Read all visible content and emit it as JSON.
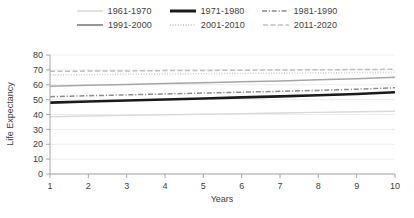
{
  "chart_data": {
    "type": "line",
    "title": "",
    "xlabel": "Years",
    "ylabel": "Life Expectancy",
    "x": [
      1,
      2,
      3,
      4,
      5,
      6,
      7,
      8,
      9,
      10
    ],
    "xlim": [
      1,
      10
    ],
    "ylim": [
      0,
      80
    ],
    "yticks": [
      0,
      10,
      20,
      30,
      40,
      50,
      60,
      70,
      80
    ],
    "xticks": [
      1,
      2,
      3,
      4,
      5,
      6,
      7,
      8,
      9,
      10
    ],
    "grid": "horizontal",
    "legend_position": "top",
    "series": [
      {
        "name": "1961-1970",
        "style": "solid",
        "color": "#d9d9d9",
        "width": 1.4,
        "values": [
          38.5,
          39.0,
          39.4,
          39.8,
          40.2,
          40.6,
          41.0,
          41.4,
          41.8,
          42.2
        ]
      },
      {
        "name": "1971-1980",
        "style": "solid",
        "color": "#1a1a1a",
        "width": 2.6,
        "values": [
          48.0,
          48.7,
          49.4,
          50.1,
          50.8,
          51.5,
          52.2,
          52.9,
          53.8,
          55.0
        ]
      },
      {
        "name": "1981-1990",
        "style": "dashdot",
        "color": "#8c8c8c",
        "width": 1.5,
        "values": [
          52.0,
          52.6,
          53.2,
          53.8,
          54.4,
          55.0,
          55.6,
          56.2,
          57.0,
          58.0
        ]
      },
      {
        "name": "1991-2000",
        "style": "solid",
        "color": "#a6a6a6",
        "width": 1.5,
        "values": [
          59.0,
          59.6,
          60.2,
          60.8,
          61.4,
          62.0,
          62.6,
          63.3,
          64.1,
          65.0
        ]
      },
      {
        "name": "2001-2010",
        "style": "dotted",
        "color": "#cfcfcf",
        "width": 1.6,
        "values": [
          66.6,
          66.8,
          67.0,
          67.2,
          67.4,
          67.6,
          67.8,
          68.0,
          68.2,
          68.4
        ]
      },
      {
        "name": "2011-2020",
        "style": "dashed",
        "color": "#bfbfbf",
        "width": 1.5,
        "values": [
          69.0,
          69.2,
          69.3,
          69.5,
          69.6,
          69.8,
          69.9,
          70.1,
          70.2,
          70.4
        ]
      }
    ]
  },
  "legend": {
    "rows": [
      [
        {
          "label": "1961-1970",
          "style": "solid",
          "color": "#d9d9d9",
          "width": 1.6
        },
        {
          "label": "1971-1980",
          "style": "solid",
          "color": "#1a1a1a",
          "width": 3.0
        },
        {
          "label": "1981-1990",
          "style": "dashdot",
          "color": "#8c8c8c",
          "width": 1.6
        }
      ],
      [
        {
          "label": "1991-2000",
          "style": "solid",
          "color": "#8c8c8c",
          "width": 1.8
        },
        {
          "label": "2001-2010",
          "style": "dotted",
          "color": "#cfcfcf",
          "width": 1.8
        },
        {
          "label": "2011-2020",
          "style": "dashed",
          "color": "#bfbfbf",
          "width": 1.6
        }
      ]
    ]
  },
  "axes": {
    "y_label": "Life Expectancy",
    "x_label": "Years",
    "y_tick_labels": [
      "80",
      "70",
      "60",
      "50",
      "40",
      "30",
      "20",
      "10",
      "0"
    ],
    "x_tick_labels": [
      "1",
      "2",
      "3",
      "4",
      "5",
      "6",
      "7",
      "8",
      "9",
      "10"
    ]
  },
  "colors": {
    "axis": "#a6a6a6",
    "grid": "#ededed",
    "text": "#404040",
    "background": "#ffffff"
  }
}
